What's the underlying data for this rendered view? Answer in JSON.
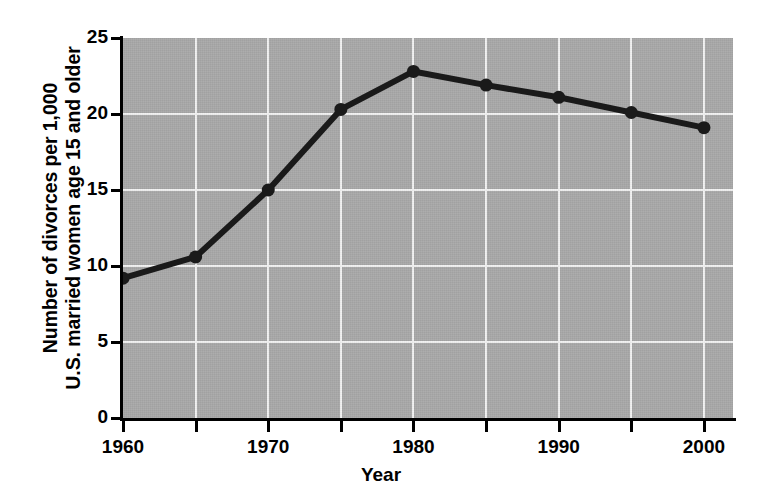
{
  "chart_data": {
    "type": "line",
    "title": "",
    "xlabel": "Year",
    "ylabel_lines": [
      "Number of divorces per 1,000",
      "U.S. married women age 15 and older"
    ],
    "ylabel": "Number of divorces per 1,000 U.S. married women age 15 and older",
    "x": [
      1960,
      1965,
      1970,
      1975,
      1980,
      1985,
      1990,
      1995,
      2000
    ],
    "values": [
      9.2,
      10.6,
      15.0,
      20.3,
      22.8,
      21.9,
      21.1,
      20.1,
      19.1
    ],
    "series": [
      {
        "name": "Divorce rate",
        "values": [
          9.2,
          10.6,
          15.0,
          20.3,
          22.8,
          21.9,
          21.1,
          20.1,
          19.1
        ]
      }
    ],
    "xlim": [
      1960,
      2002
    ],
    "ylim": [
      0,
      25
    ],
    "ytick_labels": [
      "0",
      "5",
      "10",
      "15",
      "20",
      "25"
    ],
    "ytick_values": [
      0,
      5,
      10,
      15,
      20,
      25
    ],
    "xtick_values": [
      1960,
      1965,
      1970,
      1975,
      1980,
      1985,
      1990,
      1995,
      2000
    ],
    "xtick_labels": [
      "1960",
      "",
      "1970",
      "",
      "1980",
      "",
      "1990",
      "",
      "2000"
    ],
    "xtick_labeled_values": [
      1960,
      1970,
      1980,
      1990,
      2000
    ],
    "grid": "both",
    "gridline_color": "#f2f2f2",
    "plot_background": "#a9a9a9",
    "line_color": "#1a1a1a",
    "marker": "circle",
    "legend": "none",
    "legend_position": "none"
  }
}
